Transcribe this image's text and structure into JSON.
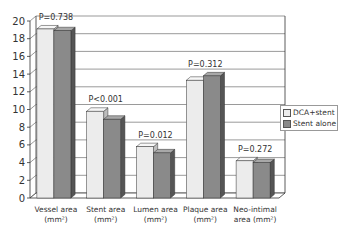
{
  "chart_data": {
    "type": "bar",
    "title": "",
    "xlabel": "",
    "ylabel": "",
    "ylim": [
      0,
      20
    ],
    "yticks": [
      0,
      2,
      4,
      6,
      8,
      10,
      12,
      14,
      16,
      18,
      20
    ],
    "grid": true,
    "legend_position": "right",
    "categories": [
      "Vessel area (mm²)",
      "Stent area (mm²)",
      "Lumen area (mm²)",
      "Plaque area (mm²)",
      "Neo-intimal area (mm²)"
    ],
    "category_lines": [
      [
        "Vessel area",
        "(mm²)"
      ],
      [
        "Stent area",
        "(mm²)"
      ],
      [
        "Lumen area",
        "(mm²)"
      ],
      [
        "Plaque area",
        "(mm²)"
      ],
      [
        "Neo-intimal",
        "area (mm²)"
      ]
    ],
    "series": [
      {
        "name": "DCA+stent",
        "color": "#ececec",
        "values": [
          19.1,
          9.8,
          5.8,
          13.3,
          4.2
        ]
      },
      {
        "name": "Stent alone",
        "color": "#8a8a8a",
        "values": [
          18.9,
          8.9,
          5.1,
          13.8,
          4.0
        ]
      }
    ],
    "annotations": [
      "P=0.738",
      "P<0.001",
      "P=0.012",
      "P=0.312",
      "P=0.272"
    ]
  },
  "legend": {
    "items": [
      {
        "label": "DCA+stent",
        "color": "#ececec"
      },
      {
        "label": "Stent alone",
        "color": "#8a8a8a"
      }
    ]
  }
}
